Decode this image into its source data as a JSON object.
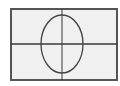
{
  "diagram": {
    "type": "ellipse-on-axes",
    "colors": {
      "background": "#ffffff",
      "panel": "#f0f0f0",
      "frame": "#555555",
      "axes": "#3a3a3a",
      "curve": "#444444"
    },
    "frame": {
      "x": 11,
      "y": 9,
      "width": 106,
      "height": 71
    },
    "axes": {
      "vertical_x": 62,
      "horizontal_y": 44
    },
    "ellipse": {
      "cx": 62,
      "cy": 44,
      "rx": 21,
      "ry": 29
    }
  }
}
